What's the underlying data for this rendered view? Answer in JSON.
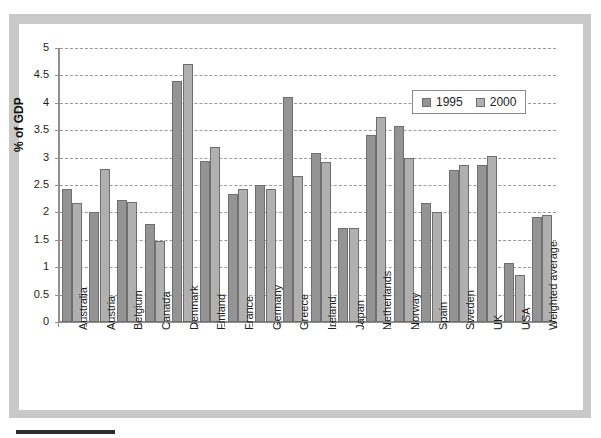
{
  "chart_data": {
    "type": "bar",
    "title": "",
    "xlabel": "",
    "ylabel": "% of GDP",
    "ylim": [
      0,
      5
    ],
    "ytick_step": 0.5,
    "yticks": [
      "5",
      "4.5",
      "4",
      "3.5",
      "3",
      "2.5",
      "2",
      "1.5",
      "1",
      "0.5",
      "0"
    ],
    "grid": true,
    "legend_position": "inside-top-right",
    "categories": [
      "Australia",
      "Austria",
      "Belgium",
      "Canada",
      "Denmark",
      "Finland",
      "France",
      "Germany",
      "Greece",
      "Ireland",
      "Japan",
      "Netherlands",
      "Norway",
      "Spain",
      "Sweden",
      "UK",
      "USA",
      "Weighted average"
    ],
    "series": [
      {
        "name": "1995",
        "color": "#949494",
        "values": [
          2.43,
          2.0,
          2.22,
          1.78,
          4.4,
          2.93,
          2.34,
          2.5,
          4.1,
          3.08,
          1.71,
          3.42,
          3.58,
          2.17,
          2.78,
          2.87,
          1.07,
          1.92
        ]
      },
      {
        "name": "2000",
        "color": "#b0b0b0",
        "values": [
          2.17,
          2.8,
          2.19,
          1.47,
          4.7,
          3.2,
          2.43,
          2.42,
          2.66,
          2.92,
          1.71,
          3.75,
          3.0,
          2.0,
          2.87,
          3.03,
          0.86,
          1.95
        ]
      }
    ]
  },
  "legend": {
    "items": [
      {
        "label": "1995",
        "color": "#949494"
      },
      {
        "label": "2000",
        "color": "#b0b0b0"
      }
    ]
  },
  "colors": {
    "series_1995": "#949494",
    "series_2000": "#b0b0b0",
    "frame": "#c9c9c9",
    "axis": "#8f8f8f",
    "grid": "#9a9a9a",
    "rule": "#2b2b2b",
    "background": "#ffffff"
  }
}
